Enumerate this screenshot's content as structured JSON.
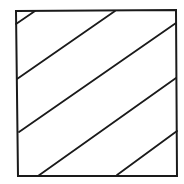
{
  "diagram": {
    "title": "",
    "stroke_color": "#1a1a1a",
    "background": "#ffffff",
    "square": {
      "points": [
        [
          16,
          11
        ],
        [
          176,
          10
        ],
        [
          177,
          176
        ],
        [
          18,
          176
        ]
      ],
      "stroke_width": 2
    },
    "hatch_lines": [
      {
        "x1": 16,
        "y1": 24,
        "x2": 35,
        "y2": 11
      },
      {
        "x1": 17,
        "y1": 79,
        "x2": 115,
        "y2": 11
      },
      {
        "x1": 19,
        "y1": 132,
        "x2": 176,
        "y2": 23
      },
      {
        "x1": 38,
        "y1": 176,
        "x2": 176,
        "y2": 78
      },
      {
        "x1": 117,
        "y1": 175,
        "x2": 177,
        "y2": 131
      }
    ],
    "hatch_stroke_width": 1.8
  }
}
